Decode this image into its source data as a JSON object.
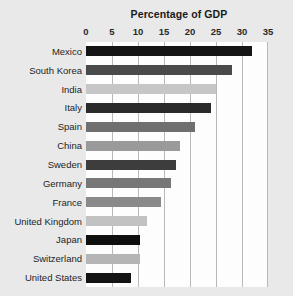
{
  "chart_data": {
    "type": "bar",
    "orientation": "horizontal",
    "title": "Percentage of GDP",
    "xlabel": "",
    "ylabel": "",
    "xlim": [
      0,
      35
    ],
    "xticks": [
      0,
      5,
      10,
      15,
      20,
      25,
      30,
      35
    ],
    "xtick_labels": [
      "0",
      "5",
      "10",
      "15",
      "20",
      "25",
      "30",
      "35"
    ],
    "grid": true,
    "grid_axis": "x",
    "legend": false,
    "categories": [
      "Mexico",
      "South Korea",
      "India",
      "Italy",
      "Spain",
      "China",
      "Sweden",
      "Germany",
      "France",
      "United Kingdom",
      "Japan",
      "Switzerland",
      "United States"
    ],
    "values": [
      32,
      28,
      25,
      24,
      21,
      18,
      17.3,
      16.3,
      14.5,
      11.8,
      10.4,
      10.4,
      8.6
    ],
    "bar_colors": [
      "#151515",
      "#4a4a4a",
      "#c6c6c6",
      "#2a2a2a",
      "#6f6f6f",
      "#9a9a9a",
      "#3d3d3d",
      "#777777",
      "#8a8a8a",
      "#c2c2c2",
      "#0f0f0f",
      "#b5b5b5",
      "#131313"
    ]
  },
  "figure": {
    "background_color": "#e9e9e9",
    "plot_background_color": "#fdfdfd",
    "gridline_color": "#b9b9b9"
  }
}
